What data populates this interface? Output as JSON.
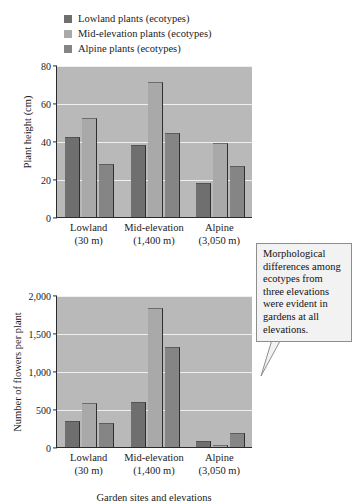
{
  "legend": {
    "items": [
      {
        "label": "Lowland plants (ecotypes)",
        "color": "#6f6f6f"
      },
      {
        "label": "Mid-elevation plants (ecotypes)",
        "color": "#a9a9a9"
      },
      {
        "label": "Alpine plants (ecotypes)",
        "color": "#858585"
      }
    ]
  },
  "callout": {
    "text": "Morphological differences among ecotypes from three elevations were evident in gardens at all elevations."
  },
  "xaxis_title": "Garden sites and elevations",
  "groups": [
    {
      "name": "Lowland",
      "elevation": "(30 m)"
    },
    {
      "name": "Mid-elevation",
      "elevation": "(1,400 m)"
    },
    {
      "name": "Alpine",
      "elevation": "(3,050 m)"
    }
  ],
  "chart_data": [
    {
      "type": "bar",
      "title": "",
      "xlabel": "Garden sites and elevations",
      "ylabel": "Plant height (cm)",
      "categories": [
        "Lowland (30 m)",
        "Mid-elevation (1,400 m)",
        "Alpine (3,050 m)"
      ],
      "ylim": [
        0,
        80
      ],
      "yticks": [
        0,
        20,
        40,
        60,
        80
      ],
      "ytick_labels": [
        "0",
        "20",
        "40",
        "60",
        "80"
      ],
      "grid": true,
      "legend_position": "top-left",
      "series": [
        {
          "name": "Lowland plants (ecotypes)",
          "color": "#6f6f6f",
          "values": [
            42,
            38,
            18
          ]
        },
        {
          "name": "Mid-elevation plants (ecotypes)",
          "color": "#a9a9a9",
          "values": [
            52,
            71,
            39
          ]
        },
        {
          "name": "Alpine plants (ecotypes)",
          "color": "#858585",
          "values": [
            28,
            44,
            27
          ]
        }
      ]
    },
    {
      "type": "bar",
      "title": "",
      "xlabel": "Garden sites and elevations",
      "ylabel": "Number of flowers per plant",
      "categories": [
        "Lowland (30 m)",
        "Mid-elevation (1,400 m)",
        "Alpine (3,050 m)"
      ],
      "ylim": [
        0,
        2000
      ],
      "yticks": [
        0,
        500,
        1000,
        1500,
        2000
      ],
      "ytick_labels": [
        "0",
        "500",
        "1,000",
        "1,500",
        "2,000"
      ],
      "grid": true,
      "legend_position": "top-left",
      "series": [
        {
          "name": "Lowland plants (ecotypes)",
          "color": "#6f6f6f",
          "values": [
            340,
            590,
            80
          ]
        },
        {
          "name": "Mid-elevation plants (ecotypes)",
          "color": "#a9a9a9",
          "values": [
            580,
            1830,
            20
          ]
        },
        {
          "name": "Alpine plants (ecotypes)",
          "color": "#858585",
          "values": [
            320,
            1310,
            180
          ]
        }
      ]
    }
  ]
}
